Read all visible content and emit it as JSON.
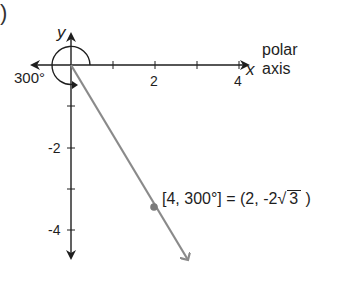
{
  "figure": {
    "label_paren": ")",
    "axes": {
      "y_label": "y",
      "x_label": "x",
      "polar_axis_label_line1": "polar",
      "polar_axis_label_line2": "axis",
      "x_ticks": [
        {
          "value": 1,
          "label": ""
        },
        {
          "value": 2,
          "label": "2"
        },
        {
          "value": 3,
          "label": ""
        },
        {
          "value": 4,
          "label": "4"
        }
      ],
      "y_ticks": [
        {
          "value": -1,
          "label": ""
        },
        {
          "value": -2,
          "label": "-2"
        },
        {
          "value": -3,
          "label": ""
        },
        {
          "value": -4,
          "label": "-4"
        }
      ]
    },
    "angle_label": "300°",
    "point": {
      "polar": "[4, 300°]",
      "equals": "=",
      "rect_prefix": "(2, -2",
      "sqrt_arg": "3",
      "rect_suffix": ")",
      "r": 4,
      "theta_deg": 300,
      "x": 2,
      "y": -3.464
    },
    "colors": {
      "axis": "#1e1e1e",
      "ray": "#8a8a8a",
      "point": "#7a7a7a"
    }
  }
}
